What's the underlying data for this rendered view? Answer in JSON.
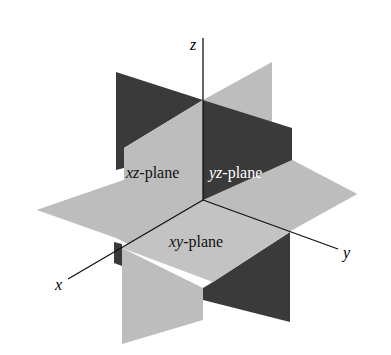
{
  "diagram": {
    "type": "3d-coordinate-planes",
    "axes": {
      "x": "x",
      "y": "y",
      "z": "z"
    },
    "planes": [
      {
        "name": "xz-plane",
        "italic": "xz",
        "suffix": "-plane"
      },
      {
        "name": "yz-plane",
        "italic": "yz",
        "suffix": "-plane"
      },
      {
        "name": "xy-plane",
        "italic": "xy",
        "suffix": "-plane"
      }
    ],
    "colors": {
      "light": "#bdbdbd",
      "dark": "#3a3a3a",
      "axis": "#111111",
      "background": "#ffffff"
    }
  }
}
